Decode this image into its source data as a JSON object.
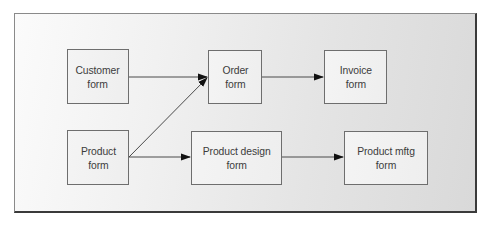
{
  "diagram": {
    "type": "flow",
    "nodes": [
      {
        "id": "customer_form",
        "label": "Customer\nform",
        "x": 67,
        "y": 49,
        "w": 62,
        "h": 55
      },
      {
        "id": "order_form",
        "label": "Order\nform",
        "x": 208,
        "y": 50,
        "w": 54,
        "h": 54
      },
      {
        "id": "invoice_form",
        "label": "Invoice\nform",
        "x": 324,
        "y": 50,
        "w": 63,
        "h": 54
      },
      {
        "id": "product_form",
        "label": "Product\nform",
        "x": 67,
        "y": 130,
        "w": 62,
        "h": 55
      },
      {
        "id": "product_design_form",
        "label": "Product design\nform",
        "x": 191,
        "y": 131,
        "w": 91,
        "h": 54
      },
      {
        "id": "product_mftg_form",
        "label": "Product mftg\nform",
        "x": 344,
        "y": 131,
        "w": 84,
        "h": 54
      }
    ],
    "edges": [
      {
        "from": "customer_form",
        "to": "order_form",
        "x1": 129,
        "y1": 77,
        "x2": 207,
        "y2": 77
      },
      {
        "from": "product_form",
        "to": "order_form",
        "x1": 129,
        "y1": 157,
        "x2": 207,
        "y2": 78
      },
      {
        "from": "order_form",
        "to": "invoice_form",
        "x1": 262,
        "y1": 77,
        "x2": 323,
        "y2": 77
      },
      {
        "from": "product_form",
        "to": "product_design_form",
        "x1": 129,
        "y1": 157,
        "x2": 190,
        "y2": 157
      },
      {
        "from": "product_design_form",
        "to": "product_mftg_form",
        "x1": 282,
        "y1": 157,
        "x2": 343,
        "y2": 157
      }
    ],
    "colors": {
      "line": "#4a4a4a",
      "arrowhead": "#111111",
      "node_border": "#6e6e6e",
      "text": "#3c3c3c"
    }
  }
}
